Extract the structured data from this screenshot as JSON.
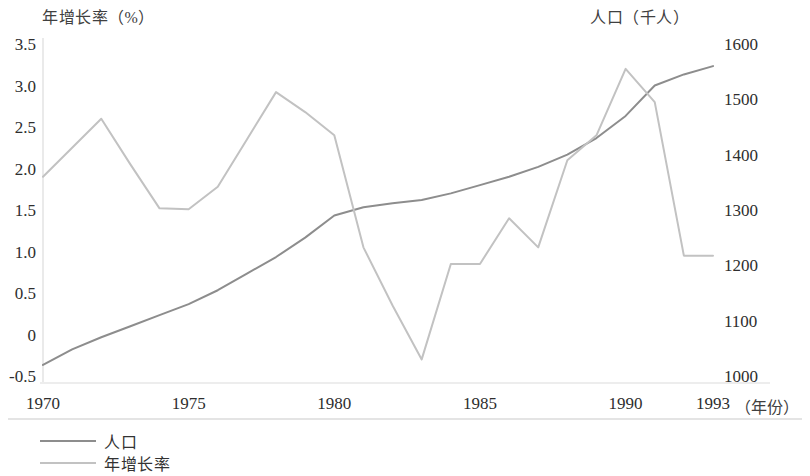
{
  "chart_data": {
    "type": "line",
    "title": "",
    "xlabel": "年份",
    "x_unit_label": "（年份）",
    "grid": false,
    "legend_position": "bottom-left",
    "x": [
      1970,
      1971,
      1972,
      1973,
      1974,
      1975,
      1976,
      1977,
      1978,
      1979,
      1980,
      1981,
      1982,
      1983,
      1984,
      1985,
      1986,
      1987,
      1988,
      1989,
      1990,
      1991,
      1992,
      1993
    ],
    "x_ticks": [
      "1970",
      "1975",
      "1980",
      "1985",
      "1990",
      "1993"
    ],
    "x_tick_values": [
      1970,
      1975,
      1980,
      1985,
      1990,
      1993
    ],
    "xlim": [
      1970,
      1993
    ],
    "axes": [
      {
        "id": "left",
        "label": "年增长率（%）",
        "ylim": [
          -0.5,
          3.5
        ],
        "ticks": [
          "3.5",
          "3.0",
          "2.5",
          "2.0",
          "1.5",
          "1.0",
          "0.5",
          "0",
          "-0.5"
        ],
        "tick_values": [
          3.5,
          3.0,
          2.5,
          2.0,
          1.5,
          1.0,
          0.5,
          0,
          -0.5
        ]
      },
      {
        "id": "right",
        "label": "人口（千人）",
        "ylim": [
          1000,
          1600
        ],
        "ticks": [
          "1600",
          "1500",
          "1400",
          "1300",
          "1200",
          "1100",
          "1000"
        ],
        "tick_values": [
          1600,
          1500,
          1400,
          1300,
          1200,
          1100,
          1000
        ]
      }
    ],
    "series": [
      {
        "name": "人口",
        "axis": "right",
        "color": "#8d8d8d",
        "unit": "千人",
        "values": [
          1020,
          1048,
          1070,
          1090,
          1110,
          1130,
          1155,
          1185,
          1215,
          1250,
          1290,
          1305,
          1312,
          1318,
          1330,
          1345,
          1360,
          1378,
          1400,
          1430,
          1470,
          1525,
          1545,
          1560
        ]
      },
      {
        "name": "年增长率",
        "axis": "left",
        "color": "#c2c2c2",
        "unit": "%",
        "values": [
          1.9,
          2.25,
          2.6,
          2.05,
          1.52,
          1.51,
          1.78,
          2.35,
          2.92,
          2.68,
          2.4,
          1.05,
          0.35,
          -0.3,
          0.85,
          0.85,
          1.4,
          1.05,
          2.1,
          2.4,
          3.2,
          2.8,
          0.95,
          0.95
        ]
      }
    ]
  },
  "legend": {
    "items": [
      {
        "label": "人口",
        "color": "#8d8d8d"
      },
      {
        "label": "年增长率",
        "color": "#c2c2c2"
      }
    ]
  },
  "geometry": {
    "plot_left": 43,
    "plot_right": 713,
    "plot_top": 44,
    "plot_bottom": 376,
    "axis_color": "#d8d8d8"
  }
}
